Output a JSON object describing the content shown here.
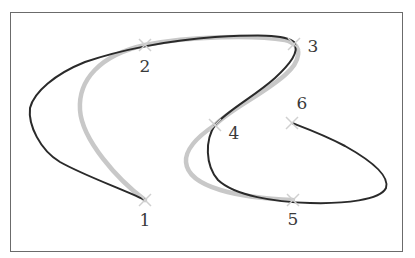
{
  "figure": {
    "colors": {
      "frame": "#6b6b6b",
      "curve_dark": "#2a2a2a",
      "curve_light": "#c8c8c8",
      "marker": "#d0d0d0",
      "label": "#3a3a3a"
    },
    "points": [
      {
        "id": "1",
        "label": "1",
        "x": 145,
        "y": 200,
        "label_x": 145,
        "label_y": 220
      },
      {
        "id": "2",
        "label": "2",
        "x": 145,
        "y": 45,
        "label_x": 145,
        "label_y": 66
      },
      {
        "id": "3",
        "label": "3",
        "x": 294,
        "y": 44,
        "label_x": 313,
        "label_y": 46
      },
      {
        "id": "4",
        "label": "4",
        "x": 215,
        "y": 125,
        "label_x": 234,
        "label_y": 133
      },
      {
        "id": "5",
        "label": "5",
        "x": 293,
        "y": 200,
        "label_x": 293,
        "label_y": 219
      },
      {
        "id": "6",
        "label": "6",
        "x": 292,
        "y": 123,
        "label_x": 302,
        "label_y": 103
      }
    ],
    "curves": [
      {
        "name": "light-interpolating-curve",
        "style": "thick light gray",
        "passes_through": [
          "1",
          "2",
          "3",
          "4",
          "5"
        ]
      },
      {
        "name": "dark-approximating-curve",
        "style": "thin dark",
        "passes_through": [
          "1",
          "2",
          "3",
          "4",
          "5",
          "6"
        ]
      }
    ]
  }
}
